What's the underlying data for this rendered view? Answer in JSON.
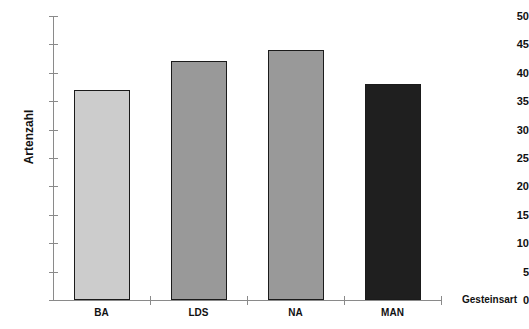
{
  "chart_data": {
    "type": "bar",
    "title": "",
    "subtitle": "",
    "categories": [
      "BA",
      "LDS",
      "NA",
      "MAN"
    ],
    "values": [
      37,
      42,
      44,
      38
    ],
    "xlabel": "Gesteinsart",
    "ylabel": "Artenzahl",
    "ylim": [
      0,
      50
    ],
    "ytick_step": 5,
    "yticks": [
      0,
      5,
      10,
      15,
      20,
      25,
      30,
      35,
      40,
      45,
      50
    ],
    "ytick_labels": [
      "0",
      "5",
      "10",
      "15",
      "20",
      "25",
      "30",
      "35",
      "40",
      "45",
      "50"
    ],
    "grid": false,
    "legend": false,
    "bar_colors": [
      "#cccccc",
      "#999999",
      "#999999",
      "#1f1f1f"
    ],
    "bar_edge_color": "#1b1b1b",
    "axis_color": "#8a8a8a",
    "text_color": "#111111",
    "background": "#ffffff"
  }
}
